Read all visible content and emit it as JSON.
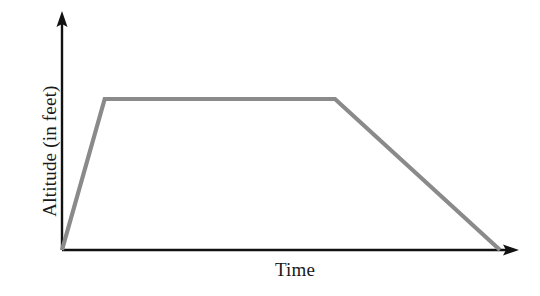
{
  "chart_data": {
    "type": "line",
    "title": "",
    "subtitle": "",
    "xlabel": "Time",
    "ylabel": "Altitude (in feet)",
    "series": [
      {
        "name": "Altitude",
        "color": "#8a8a8a",
        "points": [
          {
            "x": 0,
            "y": 0,
            "phase": "takeoff"
          },
          {
            "x": 9.5,
            "y": 100,
            "phase": "climb-top"
          },
          {
            "x": 60.7,
            "y": 100,
            "phase": "cruise-end"
          },
          {
            "x": 97.4,
            "y": 0,
            "phase": "landing"
          }
        ]
      }
    ],
    "x": [
      0,
      9.5,
      60.7,
      97.4
    ],
    "values": [
      0,
      100,
      100,
      0
    ],
    "xlim": [
      0,
      100
    ],
    "ylim": [
      0,
      125
    ],
    "grid": false,
    "legend": false,
    "legend_position": "none",
    "xticks": [],
    "yticks": [],
    "xtick_labels": [],
    "ytick_labels": [],
    "annotations": [],
    "axis_style": "arrowed-L-shape",
    "axis_color": "#111111",
    "background": "#ffffff"
  },
  "axes": {
    "x_label": "Time",
    "y_label": "Altitude (in feet)"
  },
  "icons": {
    "y_arrow": "arrow-up-icon",
    "x_arrow": "arrow-right-icon"
  }
}
